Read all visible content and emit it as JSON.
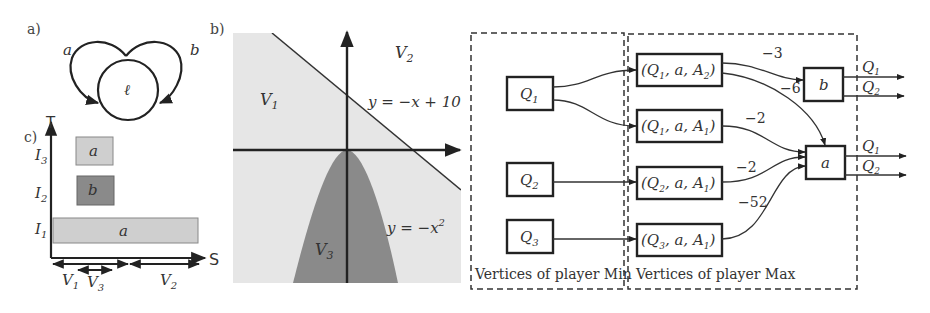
{
  "panels": {
    "a": {
      "tag": "a)",
      "location_label": "ℓ",
      "loop_labels": [
        "a",
        "b"
      ]
    },
    "b": {
      "tag": "b)",
      "regions": [
        "V1",
        "V2",
        "V3"
      ],
      "region_labels": {
        "V1": "V",
        "V1_sub": "1",
        "V2": "V",
        "V2_sub": "2",
        "V3": "V",
        "V3_sub": "3"
      },
      "equations": {
        "line": "y = −x + 10",
        "parabola_base": "y = −x",
        "parabola_exp": "2"
      },
      "colors": {
        "light_region": "#e6e6e6",
        "dark_region": "#8a8a8a"
      }
    },
    "c": {
      "tag": "c)",
      "y_axis_label": "T",
      "x_axis_label": "S",
      "y_ticks": [
        {
          "base": "I",
          "sub": "3"
        },
        {
          "base": "I",
          "sub": "2"
        },
        {
          "base": "I",
          "sub": "1"
        }
      ],
      "bars": [
        {
          "label": "a",
          "interval": "I3",
          "color": "#cfcfcf"
        },
        {
          "label": "b",
          "interval": "I2",
          "color": "#8a8a8a"
        },
        {
          "label": "a",
          "interval": "I1",
          "color": "#cfcfcf"
        }
      ],
      "x_intervals": [
        {
          "base": "V",
          "sub": "1"
        },
        {
          "base": "V",
          "sub": "3"
        },
        {
          "base": "V",
          "sub": "2"
        }
      ]
    },
    "graph": {
      "min_nodes": [
        {
          "base": "Q",
          "sub": "1"
        },
        {
          "base": "Q",
          "sub": "2"
        },
        {
          "base": "Q",
          "sub": "3"
        }
      ],
      "max_nodes": [
        {
          "text": "(Q",
          "sub": "1",
          "rest": ", a, A",
          "sub2": "2",
          "close": ")"
        },
        {
          "text": "(Q",
          "sub": "1",
          "rest": ", a, A",
          "sub2": "1",
          "close": ")"
        },
        {
          "text": "(Q",
          "sub": "2",
          "rest": ", a, A",
          "sub2": "1",
          "close": ")"
        },
        {
          "text": "(Q",
          "sub": "3",
          "rest": ", a, A",
          "sub2": "1",
          "close": ")"
        }
      ],
      "action_nodes": [
        "b",
        "a"
      ],
      "edge_weights": [
        "−3",
        "−6",
        "−2",
        "−2",
        "−52"
      ],
      "outputs": {
        "b": [
          {
            "base": "Q",
            "sub": "1"
          },
          {
            "base": "Q",
            "sub": "2"
          }
        ],
        "a": [
          {
            "base": "Q",
            "sub": "1"
          },
          {
            "base": "Q",
            "sub": "2"
          }
        ]
      },
      "captions": {
        "min": "Vertices of player Min",
        "max": "Vertices of player Max"
      }
    }
  }
}
